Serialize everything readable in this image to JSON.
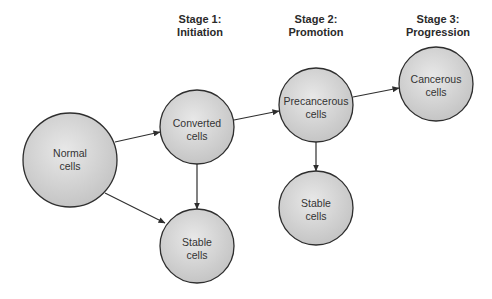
{
  "stages": [
    {
      "line1": "Stage 1:",
      "line2": "Initiation",
      "x": 200
    },
    {
      "line1": "Stage 2:",
      "line2": "Promotion",
      "x": 316
    },
    {
      "line1": "Stage 3:",
      "line2": "Progression",
      "x": 438
    }
  ],
  "nodes": [
    {
      "id": "normal",
      "line1": "Normal",
      "line2": "cells",
      "cx": 70,
      "cy": 160,
      "r": 47
    },
    {
      "id": "converted",
      "line1": "Converted",
      "line2": "cells",
      "cx": 197,
      "cy": 127,
      "r": 37
    },
    {
      "id": "stable1",
      "line1": "Stable",
      "line2": "cells",
      "cx": 197,
      "cy": 246,
      "r": 37
    },
    {
      "id": "precancerous",
      "line1": "Precancerous",
      "line2": "cells",
      "cx": 316,
      "cy": 105,
      "r": 37
    },
    {
      "id": "stable2",
      "line1": "Stable",
      "line2": "cells",
      "cx": 316,
      "cy": 208,
      "r": 37
    },
    {
      "id": "cancerous",
      "line1": "Cancerous",
      "line2": "cells",
      "cx": 436,
      "cy": 84,
      "r": 37
    }
  ],
  "edges": [
    {
      "from": "normal",
      "to": "converted"
    },
    {
      "from": "normal",
      "to": "stable1"
    },
    {
      "from": "converted",
      "to": "stable1"
    },
    {
      "from": "converted",
      "to": "precancerous"
    },
    {
      "from": "precancerous",
      "to": "stable2"
    },
    {
      "from": "precancerous",
      "to": "cancerous"
    }
  ],
  "colors": {
    "fill_light": "#e6e6e6",
    "fill_dark": "#c4c4c4",
    "stroke": "#2e2e2e",
    "text": "#333333"
  }
}
